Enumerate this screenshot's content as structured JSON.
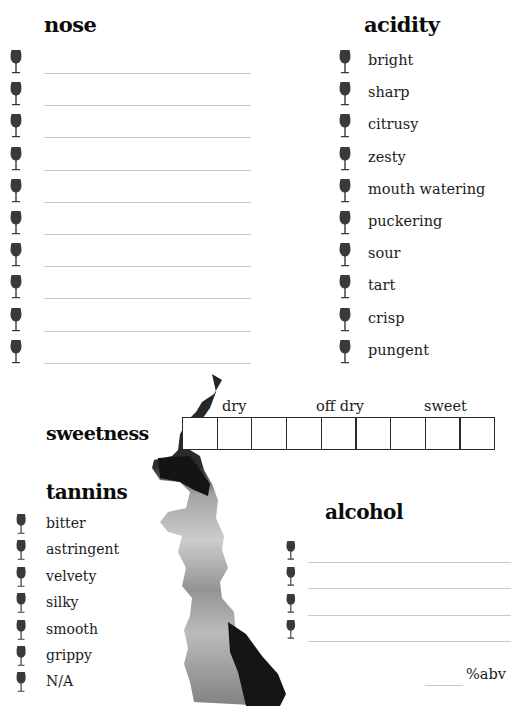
{
  "nose": {
    "heading": "nose",
    "line_count": 10,
    "icon": "wine-glass-icon"
  },
  "acidity": {
    "heading": "acidity",
    "items": [
      "bright",
      "sharp",
      "citrusy",
      "zesty",
      "mouth watering",
      "puckering",
      "sour",
      "tart",
      "crisp",
      "pungent"
    ],
    "icon": "wine-glass-icon"
  },
  "sweetness": {
    "heading": "sweetness",
    "scale_labels": [
      "dry",
      "off dry",
      "sweet"
    ],
    "box_count": 9
  },
  "tannins": {
    "heading": "tannins",
    "items": [
      "bitter",
      "astringent",
      "velvety",
      "silky",
      "smooth",
      "grippy",
      "N/A"
    ],
    "icon": "wine-glass-icon"
  },
  "alcohol": {
    "heading": "alcohol",
    "line_count": 4,
    "abv_suffix": "%abv",
    "icon": "wine-glass-icon"
  },
  "colors": {
    "ink": "#0b0b0b",
    "glass": "#3a3a3a",
    "rule": "#c9c9c9"
  }
}
